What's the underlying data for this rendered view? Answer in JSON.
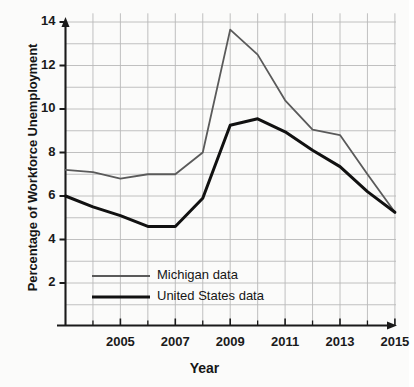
{
  "chart_data": {
    "type": "line",
    "title": "",
    "subtitle": "",
    "xlabel": "Year",
    "ylabel": "Percentage of Workforce Unemployment",
    "xlim": [
      2003,
      2015
    ],
    "ylim": [
      0,
      14
    ],
    "grid": true,
    "grid_x_step": 1,
    "grid_y_step": 1,
    "legend_position": "inside-bottom-left",
    "x_tick_labels": [
      "2005",
      "2007",
      "2009",
      "2011",
      "2013",
      "2015"
    ],
    "x_tick_values": [
      2005,
      2007,
      2009,
      2011,
      2013,
      2015
    ],
    "x_minor_ticks": [
      2004,
      2006,
      2008,
      2010,
      2012,
      2014
    ],
    "y_tick_labels": [
      "2",
      "4",
      "6",
      "8",
      "10",
      "12",
      "14"
    ],
    "y_tick_values": [
      2,
      4,
      6,
      8,
      10,
      12,
      14
    ],
    "x": [
      2003,
      2004,
      2005,
      2006,
      2007,
      2008,
      2009,
      2010,
      2011,
      2012,
      2013,
      2014,
      2015
    ],
    "series": [
      {
        "name": "Michigan data",
        "color": "#5a5a5a",
        "width": 1.8,
        "values": [
          7.2,
          7.1,
          6.8,
          7.0,
          7.0,
          8.0,
          13.65,
          12.5,
          10.4,
          9.05,
          8.8,
          7.0,
          5.25
        ]
      },
      {
        "name": "United States data",
        "color": "#111111",
        "width": 3.0,
        "values": [
          6.0,
          5.5,
          5.1,
          4.6,
          4.6,
          5.9,
          9.25,
          9.55,
          8.95,
          8.1,
          7.35,
          6.2,
          5.25
        ]
      }
    ],
    "legend": [
      {
        "label": "Michigan data",
        "color": "#5a5a5a",
        "width": 1.8
      },
      {
        "label": "United States data",
        "color": "#111111",
        "width": 3.0
      }
    ],
    "colors": {
      "background": "#fbfbfa",
      "grid": "#b9b9b9",
      "axis": "#1a1a1a",
      "michigan": "#5a5a5a",
      "united_states": "#111111"
    }
  }
}
